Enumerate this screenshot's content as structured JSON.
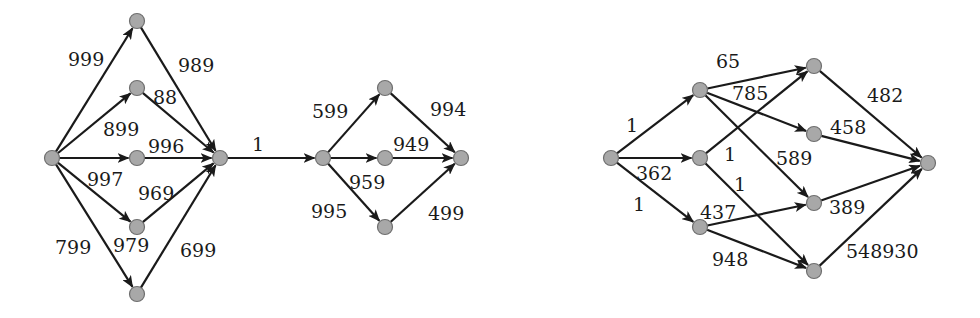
{
  "colors": {
    "node_fill": "#a8a8a8",
    "node_stroke": "#6e6e6e",
    "edge": "#1a1a1a",
    "background": "#ffffff"
  },
  "graphs": [
    {
      "name": "left-series-parallel-network",
      "nodes": {
        "s": [
          52,
          158
        ],
        "u1": [
          137,
          21
        ],
        "u2": [
          137,
          88
        ],
        "u3": [
          137,
          158
        ],
        "u4": [
          137,
          227
        ],
        "u5": [
          137,
          294
        ],
        "h": [
          220,
          158
        ],
        "m0": [
          323,
          158
        ],
        "m1": [
          385,
          88
        ],
        "m2": [
          385,
          158
        ],
        "m3": [
          385,
          227
        ],
        "t": [
          461,
          158
        ]
      },
      "edges": [
        {
          "from": "s",
          "to": "u1",
          "label": "999",
          "lx": 68,
          "ly": 66
        },
        {
          "from": "s",
          "to": "u2",
          "label": "899",
          "lx": 103,
          "ly": 136
        },
        {
          "from": "s",
          "to": "u3",
          "label": "997",
          "lx": 87,
          "ly": 186
        },
        {
          "from": "s",
          "to": "u4",
          "label": "979",
          "lx": 113,
          "ly": 252
        },
        {
          "from": "s",
          "to": "u5",
          "label": "799",
          "lx": 55,
          "ly": 254
        },
        {
          "from": "u1",
          "to": "h",
          "label": "989",
          "lx": 178,
          "ly": 72
        },
        {
          "from": "u2",
          "to": "h",
          "label": "88",
          "lx": 153,
          "ly": 104
        },
        {
          "from": "u3",
          "to": "h",
          "label": "996",
          "lx": 148,
          "ly": 153
        },
        {
          "from": "u4",
          "to": "h",
          "label": "969",
          "lx": 138,
          "ly": 200
        },
        {
          "from": "u5",
          "to": "h",
          "label": "699",
          "lx": 180,
          "ly": 257
        },
        {
          "from": "h",
          "to": "m0",
          "label": "1",
          "lx": 252,
          "ly": 151
        },
        {
          "from": "m0",
          "to": "m1",
          "label": "599",
          "lx": 312,
          "ly": 118
        },
        {
          "from": "m0",
          "to": "m2",
          "label": "959",
          "lx": 349,
          "ly": 189
        },
        {
          "from": "m0",
          "to": "m3",
          "label": "995",
          "lx": 311,
          "ly": 218
        },
        {
          "from": "m1",
          "to": "t",
          "label": "994",
          "lx": 430,
          "ly": 116
        },
        {
          "from": "m2",
          "to": "t",
          "label": "949",
          "lx": 393,
          "ly": 151
        },
        {
          "from": "m3",
          "to": "t",
          "label": "499",
          "lx": 428,
          "ly": 220
        }
      ]
    },
    {
      "name": "right-layered-network",
      "nodes": {
        "r0": [
          611,
          158
        ],
        "a": [
          700,
          90
        ],
        "b": [
          700,
          158
        ],
        "c": [
          700,
          227
        ],
        "d1": [
          814,
          66
        ],
        "d2": [
          814,
          134
        ],
        "d3": [
          814,
          203
        ],
        "d4": [
          814,
          271
        ],
        "t": [
          928,
          163
        ]
      },
      "edges": [
        {
          "from": "r0",
          "to": "a",
          "label": "1",
          "lx": 626,
          "ly": 132
        },
        {
          "from": "r0",
          "to": "b",
          "label": "362",
          "lx": 636,
          "ly": 180
        },
        {
          "from": "r0",
          "to": "c",
          "label": "1",
          "lx": 633,
          "ly": 211
        },
        {
          "from": "a",
          "to": "d1",
          "label": "65",
          "lx": 716,
          "ly": 68
        },
        {
          "from": "a",
          "to": "d2",
          "label": "785",
          "lx": 732,
          "ly": 100
        },
        {
          "from": "a",
          "to": "d3",
          "label": "589",
          "lx": 776,
          "ly": 165
        },
        {
          "from": "b",
          "to": "d1",
          "label": "1",
          "lx": 724,
          "ly": 161
        },
        {
          "from": "b",
          "to": "d4",
          "label": "1",
          "lx": 734,
          "ly": 191
        },
        {
          "from": "c",
          "to": "d3",
          "label": "437",
          "lx": 700,
          "ly": 219
        },
        {
          "from": "c",
          "to": "d4",
          "label": "948",
          "lx": 712,
          "ly": 266
        },
        {
          "from": "d1",
          "to": "t",
          "label": "482",
          "lx": 867,
          "ly": 102
        },
        {
          "from": "d2",
          "to": "t",
          "label": "458",
          "lx": 830,
          "ly": 134
        },
        {
          "from": "d3",
          "to": "t",
          "label": "389",
          "lx": 829,
          "ly": 214
        },
        {
          "from": "d4",
          "to": "t",
          "label": "548930",
          "lx": 846,
          "ly": 258
        }
      ]
    }
  ]
}
